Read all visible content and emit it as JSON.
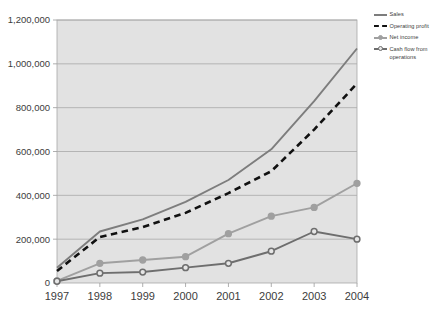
{
  "chart_data": {
    "type": "line",
    "title": "",
    "subtitle": "",
    "xlabel": "",
    "ylabel": "",
    "categories": [
      "1997",
      "1998",
      "1999",
      "2000",
      "2001",
      "2002",
      "2003",
      "2004"
    ],
    "xlim": [
      1997,
      2004
    ],
    "ylim": [
      0,
      1200000
    ],
    "ytick_labels": [
      "0",
      "200,000",
      "400,000",
      "600,000",
      "800,000",
      "1,000,000",
      "1,200,000"
    ],
    "ytick_values": [
      0,
      200000,
      400000,
      600000,
      800000,
      1000000,
      1200000
    ],
    "grid": true,
    "grid_axis": "y",
    "legend_position": "right",
    "plot_background": "#e2e2e2",
    "series": [
      {
        "name": "Sales",
        "color": "#7d7d7d",
        "style": "solid",
        "marker": "none",
        "values": [
          70000,
          235000,
          290000,
          370000,
          470000,
          610000,
          830000,
          1070000
        ]
      },
      {
        "name": "Operating profit",
        "color": "#111111",
        "style": "dashed",
        "marker": "none",
        "values": [
          55000,
          210000,
          255000,
          320000,
          410000,
          510000,
          700000,
          910000
        ]
      },
      {
        "name": "Net income",
        "color": "#a0a0a0",
        "style": "solid",
        "marker": "filled-circle",
        "values": [
          10000,
          90000,
          105000,
          120000,
          225000,
          305000,
          345000,
          455000
        ]
      },
      {
        "name": "Cash flow from operations",
        "color": "#6e6e6e",
        "style": "solid",
        "marker": "open-circle",
        "values": [
          8000,
          45000,
          50000,
          70000,
          90000,
          145000,
          235000,
          200000
        ]
      }
    ]
  },
  "legend": {
    "items": [
      {
        "label": "Sales"
      },
      {
        "label": "Operating profit"
      },
      {
        "label": "Net income"
      },
      {
        "label": "Cash flow from operations"
      }
    ]
  },
  "axes": {
    "y_labels": [
      "1,200,000",
      "1,000,000",
      "800,000",
      "600,000",
      "400,000",
      "200,000",
      "0"
    ],
    "x_labels": [
      "1997",
      "1998",
      "1999",
      "2000",
      "2001",
      "2002",
      "2003",
      "2004"
    ]
  }
}
